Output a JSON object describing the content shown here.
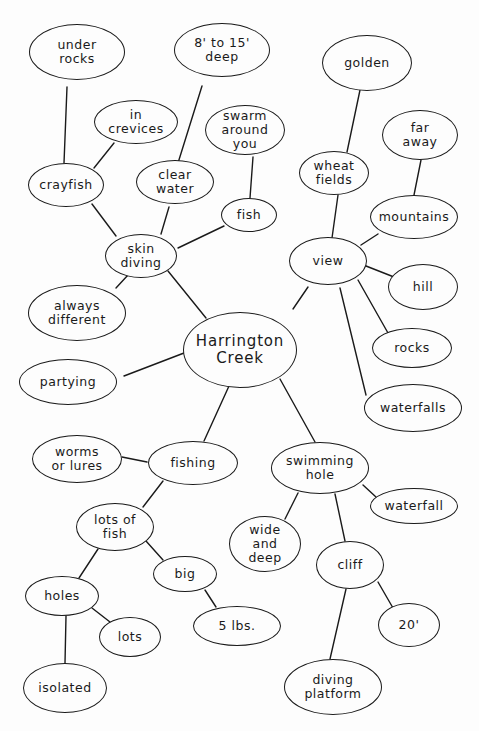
{
  "title": "Harrington Creek",
  "chart_data": {
    "type": "mind-map",
    "root": "Harrington Creek",
    "nodes": [
      {
        "id": "harrington",
        "label": "Harrington\nCreek",
        "cx": 240,
        "cy": 350,
        "rx": 57,
        "ry": 38,
        "central": true
      },
      {
        "id": "skin_diving",
        "label": "skin\ndiving",
        "cx": 141,
        "cy": 256,
        "rx": 36,
        "ry": 22
      },
      {
        "id": "crayfish",
        "label": "crayfish",
        "cx": 66,
        "cy": 185,
        "rx": 38,
        "ry": 22
      },
      {
        "id": "under_rocks",
        "label": "under\nrocks",
        "cx": 77,
        "cy": 52,
        "rx": 48,
        "ry": 28
      },
      {
        "id": "in_crevices",
        "label": "in\ncrevices",
        "cx": 136,
        "cy": 122,
        "rx": 42,
        "ry": 22
      },
      {
        "id": "clear_water",
        "label": "clear\nwater",
        "cx": 175,
        "cy": 182,
        "rx": 39,
        "ry": 22
      },
      {
        "id": "deep_8_15",
        "label": "8' to 15'\ndeep",
        "cx": 222,
        "cy": 50,
        "rx": 48,
        "ry": 27
      },
      {
        "id": "fish",
        "label": "fish",
        "cx": 249,
        "cy": 215,
        "rx": 28,
        "ry": 17
      },
      {
        "id": "swarm",
        "label": "swarm\naround\nyou",
        "cx": 245,
        "cy": 130,
        "rx": 40,
        "ry": 25
      },
      {
        "id": "always_different",
        "label": "always\ndifferent",
        "cx": 77,
        "cy": 313,
        "rx": 49,
        "ry": 28
      },
      {
        "id": "partying",
        "label": "partying",
        "cx": 68,
        "cy": 382,
        "rx": 49,
        "ry": 23
      },
      {
        "id": "view",
        "label": "view",
        "cx": 328,
        "cy": 261,
        "rx": 39,
        "ry": 24
      },
      {
        "id": "wheat_fields",
        "label": "wheat\nfields",
        "cx": 334,
        "cy": 173,
        "rx": 35,
        "ry": 22
      },
      {
        "id": "golden",
        "label": "golden",
        "cx": 367,
        "cy": 63,
        "rx": 45,
        "ry": 28
      },
      {
        "id": "mountains",
        "label": "mountains",
        "cx": 414,
        "cy": 217,
        "rx": 44,
        "ry": 22
      },
      {
        "id": "far_away",
        "label": "far\naway",
        "cx": 420,
        "cy": 135,
        "rx": 38,
        "ry": 25
      },
      {
        "id": "hill",
        "label": "hill",
        "cx": 423,
        "cy": 287,
        "rx": 35,
        "ry": 23
      },
      {
        "id": "rocks",
        "label": "rocks",
        "cx": 412,
        "cy": 348,
        "rx": 40,
        "ry": 20
      },
      {
        "id": "waterfalls",
        "label": "waterfalls",
        "cx": 413,
        "cy": 408,
        "rx": 49,
        "ry": 24
      },
      {
        "id": "fishing",
        "label": "fishing",
        "cx": 193,
        "cy": 463,
        "rx": 45,
        "ry": 22
      },
      {
        "id": "worms",
        "label": "worms\nor lures",
        "cx": 77,
        "cy": 459,
        "rx": 45,
        "ry": 24
      },
      {
        "id": "lots_of_fish",
        "label": "lots of\nfish",
        "cx": 115,
        "cy": 527,
        "rx": 39,
        "ry": 24
      },
      {
        "id": "big",
        "label": "big",
        "cx": 185,
        "cy": 574,
        "rx": 32,
        "ry": 18
      },
      {
        "id": "five_lbs",
        "label": "5 lbs.",
        "cx": 237,
        "cy": 626,
        "rx": 44,
        "ry": 20
      },
      {
        "id": "holes",
        "label": "holes",
        "cx": 62,
        "cy": 596,
        "rx": 37,
        "ry": 20
      },
      {
        "id": "lots",
        "label": "lots",
        "cx": 130,
        "cy": 637,
        "rx": 31,
        "ry": 20
      },
      {
        "id": "isolated",
        "label": "isolated",
        "cx": 65,
        "cy": 688,
        "rx": 42,
        "ry": 25
      },
      {
        "id": "swimming_hole",
        "label": "swimming\nhole",
        "cx": 320,
        "cy": 468,
        "rx": 49,
        "ry": 26
      },
      {
        "id": "waterfall",
        "label": "waterfall",
        "cx": 414,
        "cy": 506,
        "rx": 44,
        "ry": 18
      },
      {
        "id": "wide_deep",
        "label": "wide\nand\ndeep",
        "cx": 265,
        "cy": 544,
        "rx": 36,
        "ry": 28
      },
      {
        "id": "cliff",
        "label": "cliff",
        "cx": 350,
        "cy": 565,
        "rx": 34,
        "ry": 24
      },
      {
        "id": "twenty_ft",
        "label": "20'",
        "cx": 409,
        "cy": 625,
        "rx": 31,
        "ry": 22
      },
      {
        "id": "diving_platform",
        "label": "diving\nplatform",
        "cx": 333,
        "cy": 687,
        "rx": 49,
        "ry": 28
      }
    ],
    "edges": [
      {
        "from": "harrington",
        "to": "skin_diving",
        "x1": 206,
        "y1": 318,
        "x2": 168,
        "y2": 271
      },
      {
        "from": "skin_diving",
        "to": "crayfish",
        "x1": 116,
        "y1": 236,
        "x2": 92,
        "y2": 204
      },
      {
        "from": "crayfish",
        "to": "under_rocks",
        "x1": 64,
        "y1": 163,
        "x2": 67,
        "y2": 87
      },
      {
        "from": "crayfish",
        "to": "in_crevices",
        "x1": 94,
        "y1": 168,
        "x2": 114,
        "y2": 143
      },
      {
        "from": "skin_diving",
        "to": "clear_water",
        "x1": 161,
        "y1": 234,
        "x2": 169,
        "y2": 207
      },
      {
        "from": "clear_water",
        "to": "deep_8_15",
        "x1": 178,
        "y1": 163,
        "x2": 202,
        "y2": 86
      },
      {
        "from": "skin_diving",
        "to": "fish",
        "x1": 178,
        "y1": 248,
        "x2": 224,
        "y2": 226
      },
      {
        "from": "fish",
        "to": "swarm",
        "x1": 250,
        "y1": 198,
        "x2": 253,
        "y2": 157
      },
      {
        "from": "skin_diving",
        "to": "always_different",
        "x1": 128,
        "y1": 275,
        "x2": 116,
        "y2": 288
      },
      {
        "from": "harrington",
        "to": "partying",
        "x1": 184,
        "y1": 353,
        "x2": 124,
        "y2": 376
      },
      {
        "from": "harrington",
        "to": "view",
        "x1": 293,
        "y1": 309,
        "x2": 308,
        "y2": 287
      },
      {
        "from": "view",
        "to": "wheat_fields",
        "x1": 332,
        "y1": 238,
        "x2": 338,
        "y2": 195
      },
      {
        "from": "wheat_fields",
        "to": "golden",
        "x1": 347,
        "y1": 152,
        "x2": 360,
        "y2": 90
      },
      {
        "from": "view",
        "to": "mountains",
        "x1": 361,
        "y1": 245,
        "x2": 378,
        "y2": 234
      },
      {
        "from": "mountains",
        "to": "far_away",
        "x1": 414,
        "y1": 195,
        "x2": 421,
        "y2": 160
      },
      {
        "from": "view",
        "to": "hill",
        "x1": 366,
        "y1": 266,
        "x2": 394,
        "y2": 277
      },
      {
        "from": "view",
        "to": "rocks",
        "x1": 358,
        "y1": 280,
        "x2": 388,
        "y2": 333
      },
      {
        "from": "view",
        "to": "waterfalls",
        "x1": 340,
        "y1": 288,
        "x2": 366,
        "y2": 395
      },
      {
        "from": "harrington",
        "to": "fishing",
        "x1": 229,
        "y1": 386,
        "x2": 204,
        "y2": 441
      },
      {
        "from": "fishing",
        "to": "worms",
        "x1": 147,
        "y1": 462,
        "x2": 122,
        "y2": 457
      },
      {
        "from": "fishing",
        "to": "lots_of_fish",
        "x1": 163,
        "y1": 481,
        "x2": 143,
        "y2": 507
      },
      {
        "from": "lots_of_fish",
        "to": "big",
        "x1": 146,
        "y1": 541,
        "x2": 163,
        "y2": 560
      },
      {
        "from": "big",
        "to": "five_lbs",
        "x1": 205,
        "y1": 590,
        "x2": 216,
        "y2": 607
      },
      {
        "from": "lots_of_fish",
        "to": "holes",
        "x1": 98,
        "y1": 549,
        "x2": 79,
        "y2": 578
      },
      {
        "from": "holes",
        "to": "lots",
        "x1": 92,
        "y1": 608,
        "x2": 110,
        "y2": 622
      },
      {
        "from": "holes",
        "to": "isolated",
        "x1": 66,
        "y1": 616,
        "x2": 65,
        "y2": 663
      },
      {
        "from": "harrington",
        "to": "swimming_hole",
        "x1": 280,
        "y1": 379,
        "x2": 315,
        "y2": 442
      },
      {
        "from": "swimming_hole",
        "to": "waterfall",
        "x1": 363,
        "y1": 485,
        "x2": 376,
        "y2": 497
      },
      {
        "from": "swimming_hole",
        "to": "wide_deep",
        "x1": 298,
        "y1": 493,
        "x2": 285,
        "y2": 519
      },
      {
        "from": "swimming_hole",
        "to": "cliff",
        "x1": 335,
        "y1": 494,
        "x2": 345,
        "y2": 541
      },
      {
        "from": "cliff",
        "to": "twenty_ft",
        "x1": 378,
        "y1": 582,
        "x2": 393,
        "y2": 608
      },
      {
        "from": "cliff",
        "to": "diving_platform",
        "x1": 346,
        "y1": 589,
        "x2": 330,
        "y2": 659
      }
    ]
  }
}
